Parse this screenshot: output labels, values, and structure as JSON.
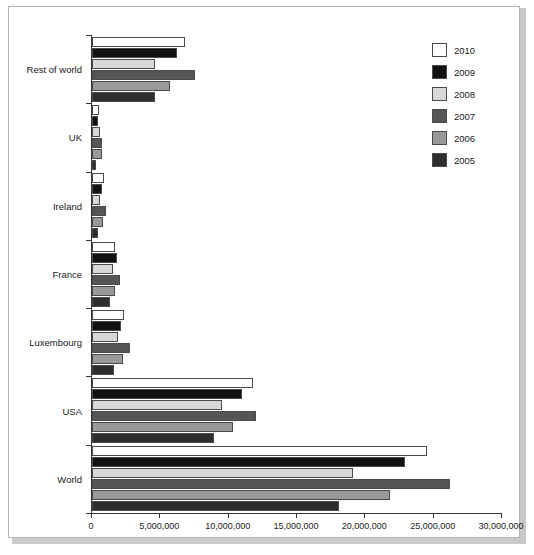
{
  "chart_data": {
    "type": "bar",
    "orientation": "horizontal",
    "title": "",
    "subtitle": "",
    "xlabel": "",
    "ylabel": "",
    "xlim": [
      0,
      30000000
    ],
    "grid": false,
    "legend_position": "top-right",
    "categories": [
      "Rest of world",
      "UK",
      "Ireland",
      "France",
      "Luxembourg",
      "USA",
      "World"
    ],
    "xticklabels": [
      "0",
      "5,000,000",
      "10,000,000",
      "15,000,000",
      "20,000,000",
      "25,000,000",
      "30,000,000"
    ],
    "xtickvalues": [
      0,
      5000000,
      10000000,
      15000000,
      20000000,
      25000000,
      30000000
    ],
    "series": [
      {
        "name": "2010",
        "color": "#ffffff",
        "values": [
          6800000,
          500000,
          900000,
          1700000,
          2350000,
          11800000,
          24500000
        ]
      },
      {
        "name": "2009",
        "color": "#111111",
        "values": [
          6200000,
          450000,
          700000,
          1800000,
          2100000,
          11000000,
          22900000
        ]
      },
      {
        "name": "2008",
        "color": "#d8d8d8",
        "values": [
          4600000,
          550000,
          600000,
          1500000,
          1900000,
          9500000,
          19100000
        ]
      },
      {
        "name": "2007",
        "color": "#565656",
        "values": [
          7500000,
          750000,
          1000000,
          2050000,
          2800000,
          12000000,
          26200000
        ]
      },
      {
        "name": "2006",
        "color": "#999999",
        "values": [
          5700000,
          700000,
          800000,
          1650000,
          2250000,
          10300000,
          21800000
        ]
      },
      {
        "name": "2005",
        "color": "#2e2e2e",
        "values": [
          4600000,
          300000,
          450000,
          1350000,
          1600000,
          8900000,
          18100000
        ]
      }
    ]
  },
  "legend": {
    "items": [
      {
        "label": "2010",
        "color": "#ffffff"
      },
      {
        "label": "2009",
        "color": "#111111"
      },
      {
        "label": "2008",
        "color": "#d8d8d8"
      },
      {
        "label": "2007",
        "color": "#565656"
      },
      {
        "label": "2006",
        "color": "#999999"
      },
      {
        "label": "2005",
        "color": "#2e2e2e"
      }
    ]
  }
}
